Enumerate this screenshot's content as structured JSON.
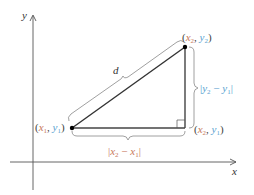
{
  "diagram": {
    "title": "",
    "axes": {
      "x_label": "x",
      "y_label": "y"
    },
    "distance_label": "d",
    "points": [
      {
        "name": "P1",
        "label_x": "x",
        "label_x_sub": "1",
        "label_y": "y",
        "label_y_sub": "1"
      },
      {
        "name": "P2",
        "label_x": "x",
        "label_x_sub": "2",
        "label_y": "y",
        "label_y_sub": "2"
      },
      {
        "name": "corner",
        "label_x": "x",
        "label_x_sub": "2",
        "label_y": "y",
        "label_y_sub": "1"
      }
    ],
    "horizontal_leg": {
      "a": "x",
      "a_sub": "2",
      "minus": "−",
      "b": "x",
      "b_sub": "1"
    },
    "vertical_leg": {
      "a": "y",
      "a_sub": "2",
      "minus": "−",
      "b": "y",
      "b_sub": "1"
    },
    "colors": {
      "x_color": "#c8785a",
      "y_color": "#5a9fd0",
      "line": "#333333",
      "axis": "#555555",
      "brace": "#888888"
    },
    "comma": ",",
    "open_paren": "(",
    "close_paren": ")",
    "bar": "|"
  }
}
